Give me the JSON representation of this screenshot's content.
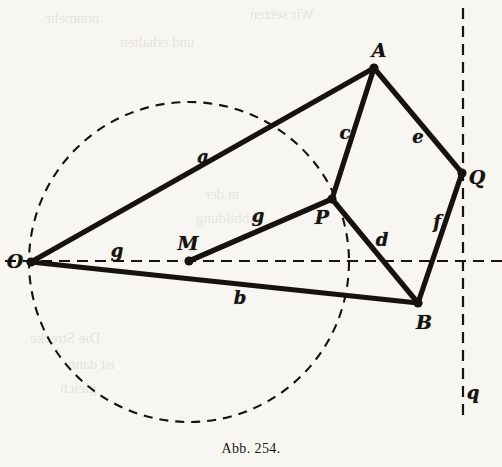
{
  "figure": {
    "caption": "Abb. 254.",
    "caption_x": 0,
    "caption_y": 441,
    "background_color": "#f7f6f2",
    "ink_color": "#16130f",
    "width": 502,
    "height": 467
  },
  "points": [
    {
      "name": "O",
      "label": "O",
      "x": 31,
      "y": 262,
      "label_x": 15,
      "label_y": 261
    },
    {
      "name": "M",
      "label": "M",
      "x": 189,
      "y": 261,
      "label_x": 188,
      "label_y": 243
    },
    {
      "name": "P",
      "label": "P",
      "x": 332,
      "y": 199,
      "label_x": 322,
      "label_y": 217
    },
    {
      "name": "A",
      "label": "A",
      "x": 374,
      "y": 68,
      "label_x": 379,
      "label_y": 50
    },
    {
      "name": "Q",
      "label": "Q",
      "x": 462,
      "y": 173,
      "label_x": 477,
      "label_y": 177
    },
    {
      "name": "B",
      "label": "B",
      "x": 418,
      "y": 303,
      "label_x": 424,
      "label_y": 322
    }
  ],
  "segments": [
    {
      "name": "a",
      "label": "a",
      "from": "O",
      "to": "A",
      "label_x": 203,
      "label_y": 157
    },
    {
      "name": "b",
      "label": "b",
      "from": "O",
      "to": "B",
      "label_x": 240,
      "label_y": 298
    },
    {
      "name": "c",
      "label": "c",
      "from": "P",
      "to": "A",
      "label_x": 345,
      "label_y": 133
    },
    {
      "name": "d",
      "label": "d",
      "from": "P",
      "to": "B",
      "label_x": 382,
      "label_y": 240
    },
    {
      "name": "e",
      "label": "e",
      "from": "A",
      "to": "Q",
      "label_x": 418,
      "label_y": 137
    },
    {
      "name": "f",
      "label": "f",
      "from": "Q",
      "to": "B",
      "label_x": 437,
      "label_y": 222
    },
    {
      "name": "g",
      "label": "g",
      "from": "M",
      "to": "P",
      "label_x": 258,
      "label_y": 216
    },
    {
      "name": "g-axis",
      "label": "g",
      "from": "O",
      "to": "M",
      "label_x": 117,
      "label_y": 251
    }
  ],
  "axes": {
    "horizontal": {
      "name": "g",
      "label": "g",
      "y": 261,
      "x_start": 5,
      "x_end": 502,
      "style": "dashed"
    },
    "vertical": {
      "name": "q",
      "label": "q",
      "x": 463,
      "y_start": 8,
      "y_end": 420,
      "style": "dashed",
      "label_x": 473,
      "label_y": 393
    }
  },
  "circle": {
    "name": "construction-circle",
    "center": "M",
    "cx": 189,
    "cy": 262,
    "r": 160,
    "style": "dashed"
  },
  "ghost_text": [
    {
      "text": "Wir setzen",
      "x": 250,
      "y": 6
    },
    {
      "text": "nunmehr",
      "x": 46,
      "y": 10
    },
    {
      "text": "und erhalten",
      "x": 120,
      "y": 34
    },
    {
      "text": "in der",
      "x": 205,
      "y": 186
    },
    {
      "text": "Abbildung",
      "x": 196,
      "y": 210
    },
    {
      "text": "Die Strecke",
      "x": 30,
      "y": 330
    },
    {
      "text": "ist dann",
      "x": 68,
      "y": 356
    },
    {
      "text": "gleich",
      "x": 60,
      "y": 380
    }
  ]
}
